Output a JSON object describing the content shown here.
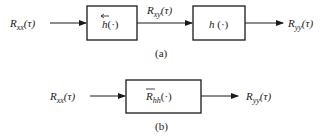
{
  "diagram_a": {
    "caption": "(a)",
    "input_label": {
      "main": "R",
      "sub": "xx",
      "arg": "(τ)"
    },
    "block1": {
      "main": "h",
      "arg": "(·)",
      "accent": "←"
    },
    "middle_label": {
      "main": "R",
      "sub": "xy",
      "arg": "(τ)"
    },
    "block2": {
      "main": "h",
      "arg": " (·)"
    },
    "output_label": {
      "main": "R",
      "sub": "yy",
      "arg": "(τ)"
    }
  },
  "diagram_b": {
    "caption": "(b)",
    "input_label": {
      "main": "R",
      "sub": "xx",
      "arg": "(τ)"
    },
    "block": {
      "main": "R",
      "sub": "hh",
      "arg": "(·)",
      "accent": "overline"
    },
    "output_label": {
      "main": "R",
      "sub": "yy",
      "arg": "(τ)"
    }
  },
  "colors": {
    "stroke": "#1a1a1a",
    "background": "#ffffff"
  }
}
